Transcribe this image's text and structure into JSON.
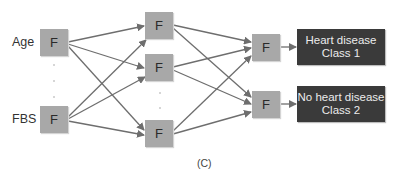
{
  "diagram": {
    "caption": "(C)",
    "node_label": "F",
    "inputs": [
      {
        "label": "Age",
        "node": "F"
      },
      {
        "label": "FBS",
        "node": "F"
      }
    ],
    "hidden_layer_1": [
      "F",
      "F",
      "F"
    ],
    "hidden_layer_2": [
      "F",
      "F"
    ],
    "outputs": [
      {
        "line1": "Heart disease",
        "line2": "Class 1"
      },
      {
        "line1": "No heart disease",
        "line2": "Class 2"
      }
    ],
    "colors": {
      "node_fill": "#a8a8a8",
      "output_fill": "#3a3a3a",
      "edge": "#6e6e6e",
      "output_text": "#ececec"
    }
  }
}
